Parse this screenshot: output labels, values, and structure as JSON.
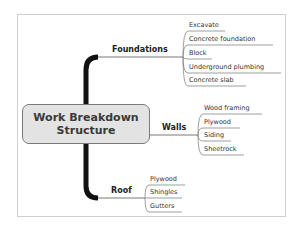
{
  "diagram": {
    "type": "mind-map",
    "central": {
      "line1": "Work Breakdown",
      "line2": "Structure"
    },
    "branches": [
      {
        "label": "Foundations",
        "children": [
          "Excavate",
          "Concrete foundation",
          "Block",
          "Underground plumbing",
          "Concrete slab"
        ]
      },
      {
        "label": "Walls",
        "children": [
          "Wood framing",
          "Plywood",
          "Siding",
          "Sheetrock"
        ]
      },
      {
        "label": "Roof",
        "children": [
          "Plywood",
          "Shingles",
          "Gutters"
        ]
      }
    ],
    "colors": {
      "central_fill": "#e3e3e3",
      "central_border": "#7a7a7a",
      "trunk": "#111111",
      "connector": "#555555",
      "frame_border": "#cfcfcf"
    }
  }
}
